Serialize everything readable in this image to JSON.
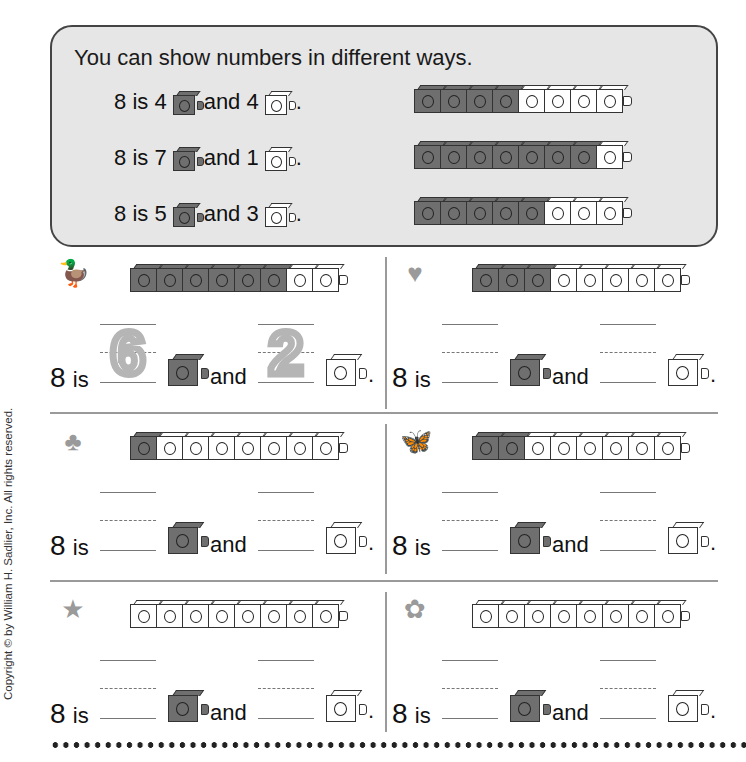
{
  "panel": {
    "title": "You can show numbers in different ways.",
    "examples": [
      {
        "total": "8",
        "is": "is",
        "dark_count": "4",
        "and": "and",
        "light_count": "1ight",
        "light": "4",
        "period": ".",
        "train": [
          1,
          1,
          1,
          1,
          0,
          0,
          0,
          0
        ]
      },
      {
        "total": "8",
        "is": "is",
        "dark_count": "7",
        "and": "and",
        "light": "1",
        "period": ".",
        "train": [
          1,
          1,
          1,
          1,
          1,
          1,
          1,
          0
        ]
      },
      {
        "total": "8",
        "is": "is",
        "dark_count": "5",
        "and": "and",
        "light": "3",
        "period": ".",
        "train": [
          1,
          1,
          1,
          1,
          1,
          0,
          0,
          0
        ]
      }
    ]
  },
  "exercises": [
    {
      "symbol": "duck-icon",
      "glyph": "🦆",
      "train": [
        1,
        1,
        1,
        1,
        1,
        1,
        0,
        0
      ],
      "lead": "8",
      "is": "is",
      "and": "and",
      "period": ".",
      "answer_dark": "6",
      "answer_light": "2",
      "traced": true
    },
    {
      "symbol": "heart-icon",
      "glyph": "♥",
      "train": [
        1,
        1,
        1,
        0,
        0,
        0,
        0,
        0
      ],
      "lead": "8",
      "is": "is",
      "and": "and",
      "period": ".",
      "answer_dark": "",
      "answer_light": "",
      "traced": false
    },
    {
      "symbol": "clover-icon",
      "glyph": "♣",
      "train": [
        1,
        0,
        0,
        0,
        0,
        0,
        0,
        0
      ],
      "lead": "8",
      "is": "is",
      "and": "and",
      "period": ".",
      "answer_dark": "",
      "answer_light": "",
      "traced": false
    },
    {
      "symbol": "butterfly-icon",
      "glyph": "🦋",
      "train": [
        1,
        1,
        0,
        0,
        0,
        0,
        0,
        0
      ],
      "lead": "8",
      "is": "is",
      "and": "and",
      "period": ".",
      "answer_dark": "",
      "answer_light": "",
      "traced": false
    },
    {
      "symbol": "star-icon",
      "glyph": "★",
      "train": [
        0,
        0,
        0,
        0,
        0,
        0,
        0,
        0
      ],
      "lead": "8",
      "is": "is",
      "and": "and",
      "period": ".",
      "answer_dark": "",
      "answer_light": "",
      "traced": false
    },
    {
      "symbol": "flower-icon",
      "glyph": "✿",
      "train": [
        0,
        0,
        0,
        0,
        0,
        0,
        0,
        0
      ],
      "lead": "8",
      "is": "is",
      "and": "and",
      "period": ".",
      "answer_dark": "",
      "answer_light": "",
      "traced": false
    }
  ],
  "copyright": "Copyright © by William H. Sadlier, Inc. All rights reserved.",
  "colors": {
    "dark_cube": "#6f6f6f",
    "light_cube": "#ffffff",
    "panel_bg": "#e6e6e6",
    "trace": "#b5b5b5"
  }
}
